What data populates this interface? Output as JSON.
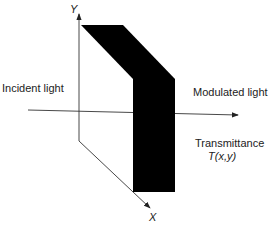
{
  "labels": {
    "y_axis": "Y",
    "x_axis": "X",
    "incident": "Incident light",
    "modulated": "Modulated light",
    "transmittance": "Transmittance",
    "transmittance_fn": "T(x,y)"
  },
  "colors": {
    "ink": "#000000",
    "line": "#333333",
    "background": "#ffffff"
  }
}
